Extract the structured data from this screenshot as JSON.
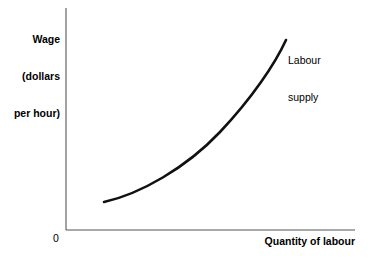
{
  "chart_data": {
    "type": "line",
    "title": "",
    "subtitle": "",
    "xlabel": "Quantity of labour",
    "ylabel": "Wage (dollars per hour)",
    "ylabel_lines": [
      "Wage",
      "(dollars",
      "per hour)"
    ],
    "origin_label": "0",
    "grid": false,
    "legend_position": "inline-annotation",
    "xlim": [
      0,
      100
    ],
    "ylim": [
      0,
      100
    ],
    "xticks": [],
    "yticks": [],
    "xticklabels": [],
    "yticklabels": [],
    "axis_color": "#555555",
    "curve_color": "#111111",
    "series": [
      {
        "name": "Labour supply",
        "label_lines": [
          "Labour",
          "supply"
        ],
        "annotation": "Labour supply",
        "color": "#111111",
        "shape": "convex increasing",
        "points": [
          {
            "x": 13.2,
            "y": 12.6
          },
          {
            "x": 20.0,
            "y": 16.0
          },
          {
            "x": 27.0,
            "y": 20.5
          },
          {
            "x": 34.0,
            "y": 26.0
          },
          {
            "x": 41.0,
            "y": 32.5
          },
          {
            "x": 48.0,
            "y": 40.0
          },
          {
            "x": 55.0,
            "y": 48.5
          },
          {
            "x": 62.0,
            "y": 58.0
          },
          {
            "x": 69.0,
            "y": 68.5
          },
          {
            "x": 76.0,
            "y": 80.0
          },
          {
            "x": 76.2,
            "y": 85.6
          }
        ]
      }
    ],
    "annotations": [
      {
        "text": "Labour supply",
        "x": 77.0,
        "y": 89.0
      }
    ]
  },
  "geometry": {
    "axis_origin_x": 66,
    "axis_origin_y": 230,
    "axis_top_y": 8,
    "axis_right_x": 355,
    "curve_path": "M 104 202 C 140 194, 186 168, 220 132 C 252 98, 275 64, 286 40"
  }
}
